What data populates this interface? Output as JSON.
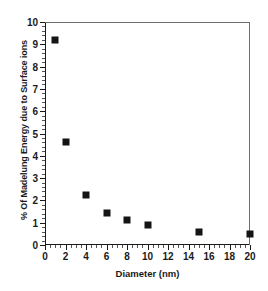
{
  "chart_data": {
    "type": "scatter",
    "title": "",
    "xlabel": "Diameter (nm)",
    "ylabel": "% Of Madelung Energy due to Surface ions",
    "xlim": [
      0,
      20
    ],
    "ylim": [
      0,
      10
    ],
    "grid": false,
    "legend": null,
    "marker": "filled-square",
    "marker_color": "#141414",
    "x_major_ticks": [
      0,
      2,
      4,
      6,
      8,
      10,
      12,
      14,
      16,
      18,
      20
    ],
    "x_tick_labels": [
      "0",
      "2",
      "4",
      "6",
      "8",
      "10",
      "12",
      "14",
      "16",
      "18",
      "20"
    ],
    "x_minor_interval": 0.5,
    "y_major_ticks": [
      0,
      1,
      2,
      3,
      4,
      5,
      6,
      7,
      8,
      9,
      10
    ],
    "y_tick_labels": [
      "0",
      "1",
      "2",
      "3",
      "4",
      "5",
      "6",
      "7",
      "8",
      "9",
      "10"
    ],
    "y_minor_interval": 0.2,
    "x": [
      1,
      2,
      4,
      6,
      8,
      10,
      15,
      20
    ],
    "values": [
      9.2,
      4.6,
      2.25,
      1.45,
      1.1,
      0.9,
      0.6,
      0.5
    ],
    "points": [
      {
        "x": 1,
        "y": 9.2
      },
      {
        "x": 2,
        "y": 4.6
      },
      {
        "x": 4,
        "y": 2.25
      },
      {
        "x": 6,
        "y": 1.45
      },
      {
        "x": 8,
        "y": 1.1
      },
      {
        "x": 10,
        "y": 0.9
      },
      {
        "x": 15,
        "y": 0.6
      },
      {
        "x": 20,
        "y": 0.5
      }
    ]
  }
}
